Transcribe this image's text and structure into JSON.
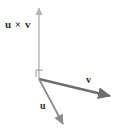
{
  "figure": {
    "width": 120,
    "height": 136,
    "background_color": "#ffffff"
  },
  "labels": {
    "cross_product": "u × v",
    "v": "v",
    "u": "u"
  },
  "colors": {
    "cross_product_arrow": "#b3b3b3",
    "v_arrow": "#6e6e6e",
    "u_arrow": "#8c8c8c",
    "right_angle_marker": "#9a9a9a",
    "label_text": "#2b2b2b"
  },
  "geometry": {
    "origin": {
      "x": 39,
      "y": 79
    },
    "vectors": [
      {
        "name": "u-cross-v",
        "label": "u × v",
        "from": {
          "x": 39,
          "y": 79
        },
        "to": {
          "x": 39,
          "y": 6
        },
        "stroke_width": 1.4,
        "color": "#b3b3b3"
      },
      {
        "name": "v",
        "label": "v",
        "from": {
          "x": 39,
          "y": 79
        },
        "to": {
          "x": 113,
          "y": 97
        },
        "stroke_width": 2.6,
        "color": "#6e6e6e"
      },
      {
        "name": "u",
        "label": "u",
        "from": {
          "x": 39,
          "y": 79
        },
        "to": {
          "x": 65,
          "y": 128
        },
        "stroke_width": 1.8,
        "color": "#8c8c8c"
      }
    ],
    "right_angle_marker": {
      "x": 36,
      "y": 69,
      "size": 7,
      "color": "#9a9a9a"
    }
  }
}
